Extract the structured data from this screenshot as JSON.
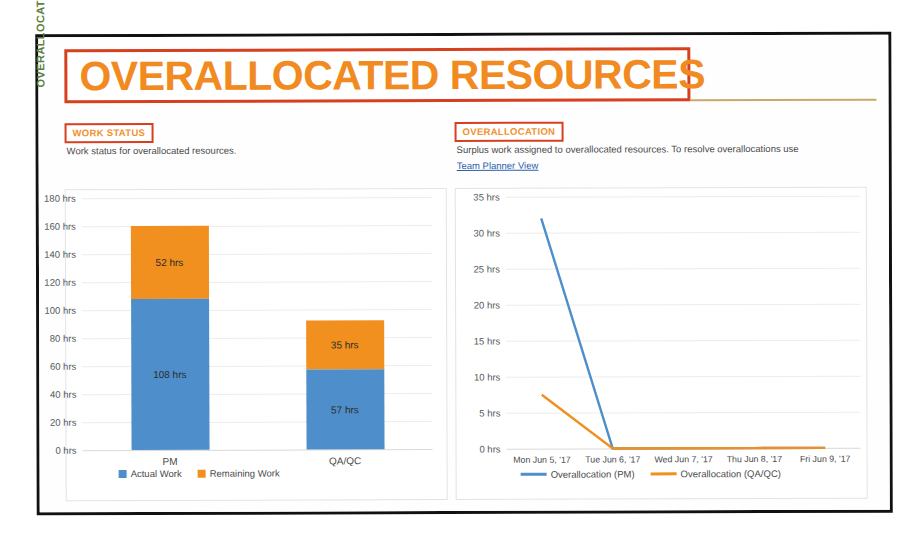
{
  "page": {
    "title": "OVERALLOCATED RESOURCES",
    "accent_orange": "#F18A21",
    "accent_red": "#D6401E",
    "axis_title_green": "#5E7F3C",
    "series_blue": "#4E8FCB",
    "series_orange": "#F1901F"
  },
  "work_status": {
    "tag": "WORK STATUS",
    "description": "Work status for overallocated resources.",
    "vertical_axis_title": "OVERALLOCATED RESOURCES"
  },
  "overallocation": {
    "tag": "OVERALLOCATION",
    "description": "Surplus work assigned to overallocated resources. To resolve overallocations use",
    "link": "Team Planner View"
  },
  "chart_data": [
    {
      "type": "bar",
      "stacked": true,
      "title": "Work Status",
      "categories": [
        "PM",
        "QA/QC"
      ],
      "series": [
        {
          "name": "Actual Work",
          "color": "#4E8FCB",
          "values": [
            108,
            57
          ],
          "labels": [
            "108 hrs",
            "57 hrs"
          ]
        },
        {
          "name": "Remaining Work",
          "color": "#F1901F",
          "values": [
            52,
            35
          ],
          "labels": [
            "52 hrs",
            "35 hrs"
          ]
        }
      ],
      "ylabel": "OVERALLOCATED RESOURCES",
      "xlabel": "",
      "ylim": [
        0,
        180
      ],
      "ytick_step": 20,
      "ytick_labels": [
        "180 hrs",
        "160 hrs",
        "140 hrs",
        "120 hrs",
        "100 hrs",
        "80 hrs",
        "60 hrs",
        "40 hrs",
        "20 hrs",
        "0 hrs"
      ],
      "grid": true,
      "legend_position": "bottom"
    },
    {
      "type": "line",
      "title": "Overallocation",
      "x": [
        "Mon Jun 5, '17",
        "Tue Jun 6, '17",
        "Wed Jun 7, '17",
        "Thu Jun 8, '17",
        "Fri Jun 9, '17"
      ],
      "series": [
        {
          "name": "Overallocation (PM)",
          "color": "#4E8FCB",
          "values": [
            32,
            0,
            0,
            0,
            0
          ]
        },
        {
          "name": "Overallocation (QA/QC)",
          "color": "#F1901F",
          "values": [
            7.5,
            0,
            0,
            0,
            0
          ]
        }
      ],
      "ylabel": "",
      "xlabel": "",
      "ylim": [
        0,
        35
      ],
      "ytick_step": 5,
      "ytick_labels": [
        "35 hrs",
        "30 hrs",
        "25 hrs",
        "20 hrs",
        "15 hrs",
        "10 hrs",
        "5 hrs",
        "0 hrs"
      ],
      "grid": true,
      "legend_position": "bottom"
    }
  ]
}
